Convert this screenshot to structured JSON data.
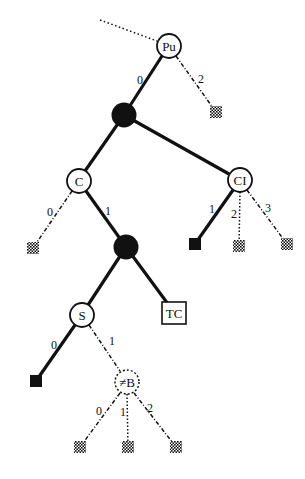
{
  "diagram": {
    "type": "tree",
    "nodes": [
      {
        "id": "pu",
        "label": "Pu",
        "kind": "circle",
        "x": 169,
        "y": 46
      },
      {
        "id": "n1",
        "label": "",
        "kind": "filled-circle",
        "x": 124,
        "y": 115
      },
      {
        "id": "c",
        "label": "C",
        "kind": "circle",
        "x": 79,
        "y": 181
      },
      {
        "id": "ci",
        "label": "CI",
        "kind": "circle",
        "x": 240,
        "y": 180
      },
      {
        "id": "n2",
        "label": "",
        "kind": "filled-circle",
        "x": 126,
        "y": 247
      },
      {
        "id": "s",
        "label": "S",
        "kind": "circle",
        "x": 82,
        "y": 315
      },
      {
        "id": "tc",
        "label": "TC",
        "kind": "box",
        "x": 174,
        "y": 313
      },
      {
        "id": "nb",
        "label": "≠B",
        "kind": "dashed-circle",
        "x": 127,
        "y": 382
      }
    ],
    "leaves": [
      {
        "id": "l_pu2",
        "kind": "hatched",
        "x": 216,
        "y": 112
      },
      {
        "id": "l_c0",
        "kind": "hatched",
        "x": 33,
        "y": 248
      },
      {
        "id": "l_ci1",
        "kind": "solid",
        "x": 195,
        "y": 244
      },
      {
        "id": "l_ci2",
        "kind": "hatched",
        "x": 239,
        "y": 246
      },
      {
        "id": "l_ci3",
        "kind": "hatched",
        "x": 287,
        "y": 244
      },
      {
        "id": "l_s0",
        "kind": "solid",
        "x": 36,
        "y": 381
      },
      {
        "id": "l_b0",
        "kind": "hatched",
        "x": 80,
        "y": 447
      },
      {
        "id": "l_b1",
        "kind": "hatched",
        "x": 128,
        "y": 447
      },
      {
        "id": "l_b2",
        "kind": "hatched",
        "x": 176,
        "y": 447
      }
    ],
    "edges": [
      {
        "from": "incoming",
        "to": "pu",
        "style": "dotted",
        "label": ""
      },
      {
        "from": "pu",
        "to": "n1",
        "style": "solid",
        "label": "0"
      },
      {
        "from": "pu",
        "to": "l_pu2",
        "style": "dashdot",
        "label": "2"
      },
      {
        "from": "n1",
        "to": "c",
        "style": "solid",
        "label": ""
      },
      {
        "from": "n1",
        "to": "ci",
        "style": "solid",
        "label": ""
      },
      {
        "from": "c",
        "to": "l_c0",
        "style": "dashdot",
        "label": "0"
      },
      {
        "from": "c",
        "to": "n2",
        "style": "solid",
        "label": "1"
      },
      {
        "from": "ci",
        "to": "l_ci1",
        "style": "solid",
        "label": "1"
      },
      {
        "from": "ci",
        "to": "l_ci2",
        "style": "dotted",
        "label": "2"
      },
      {
        "from": "ci",
        "to": "l_ci3",
        "style": "dashdot",
        "label": "3"
      },
      {
        "from": "n2",
        "to": "s",
        "style": "solid",
        "label": ""
      },
      {
        "from": "n2",
        "to": "tc",
        "style": "solid",
        "label": ""
      },
      {
        "from": "s",
        "to": "l_s0",
        "style": "solid",
        "label": "0"
      },
      {
        "from": "s",
        "to": "nb",
        "style": "dashdot",
        "label": "1"
      },
      {
        "from": "nb",
        "to": "l_b0",
        "style": "dashdot",
        "label": "0"
      },
      {
        "from": "nb",
        "to": "l_b1",
        "style": "dotted",
        "label": "1"
      },
      {
        "from": "nb",
        "to": "l_b2",
        "style": "dashdot",
        "label": "2"
      }
    ]
  },
  "labels": {
    "pu": "Pu",
    "c": "C",
    "ci": "CI",
    "s": "S",
    "tc": "TC",
    "nb": "≠B",
    "e_pu_0": "0",
    "e_pu_2": "2",
    "e_c_0": "0",
    "e_c_1": "1",
    "e_ci_1": "1",
    "e_ci_2": "2",
    "e_ci_3": "3",
    "e_s_0": "0",
    "e_s_1": "1",
    "e_b_0": "0",
    "e_b_1": "1",
    "e_b_2": "2"
  },
  "colors": {
    "ink": "#111111",
    "background": "#ffffff"
  }
}
